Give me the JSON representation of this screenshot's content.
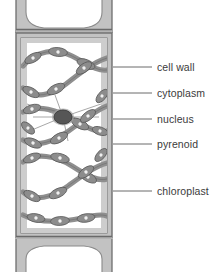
{
  "figure": {
    "background_color": "#ffffff"
  },
  "colors": {
    "cell_wall_fill": "#c2c2c2",
    "cell_wall_outline": "#6e6e6e",
    "cytoplasm_fill": "#cdcdcd",
    "vacuole_fill": "#ffffff",
    "chloroplast_fill": "#9a9a9a",
    "chloroplast_outline": "#5e5e5e",
    "pyrenoid_fill": "#ededed",
    "nucleus_fill": "#565656",
    "nucleus_outline": "#3a3a3a",
    "strand_color": "#8d8d8d",
    "leader_line": "#595959",
    "label_text": "#3b3b3b"
  },
  "labels": [
    {
      "id": "cell-wall",
      "text": "cell wall",
      "text_x": 157,
      "text_y": 62,
      "leader": {
        "x1": 113,
        "y1": 67,
        "x2": 152,
        "y2": 67
      }
    },
    {
      "id": "cytoplasm",
      "text": "cytoplasm",
      "text_x": 157,
      "text_y": 88,
      "leader": {
        "x1": 113,
        "y1": 93,
        "x2": 152,
        "y2": 93
      }
    },
    {
      "id": "nucleus",
      "text": "nucleus",
      "text_x": 157,
      "text_y": 114,
      "leader": {
        "x1": 113,
        "y1": 119,
        "x2": 152,
        "y2": 119
      }
    },
    {
      "id": "pyrenoid",
      "text": "pyrenoid",
      "text_x": 157,
      "text_y": 139,
      "leader": {
        "x1": 113,
        "y1": 144,
        "x2": 152,
        "y2": 144
      }
    },
    {
      "id": "chloroplast",
      "text": "chloroplast",
      "text_x": 157,
      "text_y": 186,
      "leader": {
        "x1": 113,
        "y1": 191,
        "x2": 152,
        "y2": 191
      }
    }
  ],
  "structures": {
    "cell_wall_label": "cell wall",
    "cytoplasm_label": "cytoplasm",
    "nucleus_label": "nucleus",
    "pyrenoid_label": "pyrenoid",
    "chloroplast_label": "chloroplast"
  },
  "geometry": {
    "cell_left": 16,
    "cell_right": 112,
    "cell_top": 33,
    "cell_bottom": 238,
    "wall_thickness": 6,
    "nucleus_center_x": 63,
    "nucleus_center_y": 117,
    "nucleus_rx": 9,
    "nucleus_ry": 7,
    "pyrenoid_count": 24
  }
}
